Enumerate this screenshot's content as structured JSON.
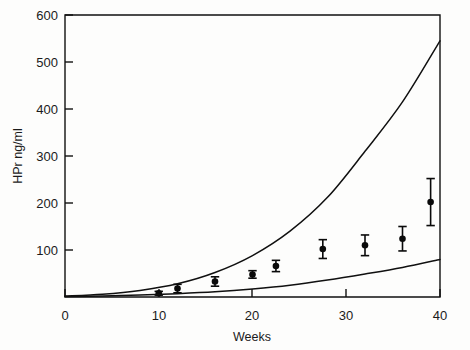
{
  "chart_data": {
    "type": "scatter",
    "title": "",
    "xlabel": "Weeks",
    "ylabel": "HPr ng/ml",
    "xlim": [
      0,
      40
    ],
    "ylim": [
      0,
      600
    ],
    "grid": false,
    "legend": "none",
    "x_ticks": [
      0,
      10,
      20,
      30,
      40
    ],
    "x_tick_labels": [
      "0",
      "10",
      "20",
      "30",
      "40"
    ],
    "y_ticks": [
      100,
      200,
      300,
      400,
      500,
      600
    ],
    "y_tick_labels": [
      "100",
      "200",
      "300",
      "400",
      "500",
      "600"
    ],
    "series": [
      {
        "name": "Measured HPr",
        "type": "scatter-errorbar",
        "marker": "filled-circle",
        "color": "#0a0a0a",
        "points": [
          {
            "x": 10.0,
            "y": 8,
            "yerr": 4
          },
          {
            "x": 12.0,
            "y": 18,
            "yerr": 9
          },
          {
            "x": 16.0,
            "y": 33,
            "yerr": 10
          },
          {
            "x": 20.0,
            "y": 48,
            "yerr": 8
          },
          {
            "x": 22.5,
            "y": 66,
            "yerr": 12
          },
          {
            "x": 27.5,
            "y": 102,
            "yerr": 20
          },
          {
            "x": 32.0,
            "y": 110,
            "yerr": 22
          },
          {
            "x": 36.0,
            "y": 124,
            "yerr": 26
          },
          {
            "x": 39.0,
            "y": 202,
            "yerr": 50
          }
        ]
      },
      {
        "name": "Upper boundary curve",
        "type": "line",
        "color": "#101010",
        "x": [
          0,
          4,
          8,
          12,
          16,
          20,
          24,
          28,
          32,
          36,
          40
        ],
        "y": [
          2,
          6,
          14,
          28,
          52,
          88,
          140,
          212,
          310,
          415,
          545
        ]
      },
      {
        "name": "Lower boundary curve",
        "type": "line",
        "color": "#101010",
        "x": [
          0,
          4,
          8,
          12,
          16,
          20,
          24,
          28,
          32,
          36,
          40
        ],
        "y": [
          1,
          2,
          4,
          7,
          11,
          17,
          25,
          36,
          49,
          63,
          80
        ]
      }
    ]
  },
  "axes": {
    "y_axis_title": "HPr ng/ml",
    "x_axis_title": "Weeks"
  }
}
